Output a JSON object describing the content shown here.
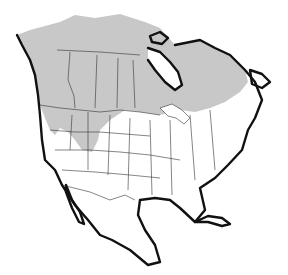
{
  "map": {
    "type": "range-map",
    "region": "North America",
    "range_color": "#c8c8c8",
    "coast_color": "#111111",
    "border_color": "#333333",
    "background": "#ffffff",
    "range_description": "Shaded range covers northern Canada and Alaska south into northern US Rockies and Great Basin"
  }
}
